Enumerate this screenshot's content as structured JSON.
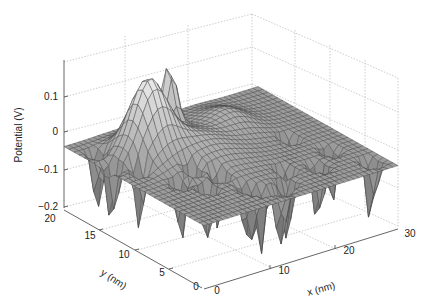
{
  "chart_data": {
    "type": "surface3d",
    "title": "",
    "xlabel": "x (nm)",
    "ylabel": "y (nm)",
    "zlabel": "Potential (V)",
    "xlim": [
      0,
      30
    ],
    "ylim": [
      0,
      20
    ],
    "zlim": [
      -0.2,
      0.15
    ],
    "x_ticks": [
      "0",
      "10",
      "20",
      "30"
    ],
    "y_ticks": [
      "0",
      "5",
      "10",
      "15",
      "20"
    ],
    "z_ticks": [
      "-0.2",
      "-0.1",
      "0",
      "0.1"
    ],
    "grid": true,
    "colormap": "grayscale",
    "features": [
      {
        "label": "peak",
        "x": 7,
        "y": 14,
        "z": 0.13
      },
      {
        "label": "peak",
        "x": 13,
        "y": 17,
        "z": 0.12
      },
      {
        "label": "baseline plateau",
        "z": -0.05
      },
      {
        "label": "sharp dips",
        "z": -0.2,
        "count_approx": 14
      }
    ]
  },
  "labels": {
    "z_axis": "Potential (V)",
    "y_axis": "y (nm)",
    "x_axis": "x (nm)",
    "z_tick_0": "0.1",
    "z_tick_1": "0",
    "z_tick_2": "−0.1",
    "z_tick_3": "−0.2",
    "y_tick_20": "20",
    "y_tick_15": "15",
    "y_tick_10": "10",
    "y_tick_5": "5",
    "y_tick_0": "0",
    "x_tick_0": "0",
    "x_tick_10": "10",
    "x_tick_20": "20",
    "x_tick_30": "30"
  }
}
